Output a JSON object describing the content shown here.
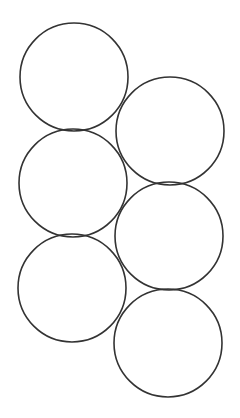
{
  "canvas": {
    "width": 240,
    "height": 418,
    "background": "#ffffff"
  },
  "style": {
    "stroke": "#333333",
    "stroke_width": 1.6
  },
  "circles": [
    {
      "id": "left-1",
      "cx": 74,
      "cy": 77,
      "r": 54
    },
    {
      "id": "right-1",
      "cx": 170,
      "cy": 131,
      "r": 54
    },
    {
      "id": "left-2",
      "cx": 73,
      "cy": 183,
      "r": 54
    },
    {
      "id": "right-2",
      "cx": 169,
      "cy": 236,
      "r": 54
    },
    {
      "id": "left-3",
      "cx": 72,
      "cy": 288,
      "r": 54
    },
    {
      "id": "right-3",
      "cx": 168,
      "cy": 343,
      "r": 54
    }
  ]
}
